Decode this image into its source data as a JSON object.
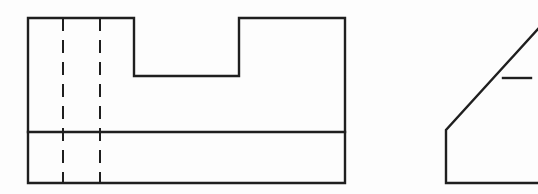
{
  "canvas": {
    "width": 538,
    "height": 194,
    "background_color": "#fdfdfd",
    "line_color": "#1f1f1f",
    "solid_stroke_width": 2.4,
    "hidden_stroke_width": 2.0,
    "hidden_dash_pattern": "13 9"
  },
  "drawing": {
    "type": "orthographic-engineering-drawing",
    "title": "",
    "views": [
      {
        "id": "front-view",
        "name": "Front view with central slot",
        "outline_label": "stepped block outline",
        "outline_points": "28,18 134,18 134,76 239,76 239,18 345,18 345,183 28,183 28,18",
        "features": [
          {
            "id": "horizontal-divider",
            "name": "horizontal divider line",
            "style": "solid",
            "x1": 28,
            "y1": 132,
            "x2": 345,
            "y2": 132
          },
          {
            "id": "hidden-line-left",
            "name": "left hidden edge",
            "style": "hidden",
            "x1": 63,
            "y1": 18,
            "x2": 63,
            "y2": 183
          },
          {
            "id": "hidden-line-right",
            "name": "right hidden edge",
            "style": "hidden",
            "x1": 100,
            "y1": 18,
            "x2": 100,
            "y2": 183
          }
        ]
      },
      {
        "id": "side-view",
        "name": "Side view with chamfer",
        "outline_label": "chamfered block outline",
        "polyline_points": "538,29 446,130 446,183 538,183",
        "features": [
          {
            "id": "chamfer-tick",
            "name": "chamfer reference tick",
            "style": "solid",
            "x1": 503,
            "y1": 78,
            "x2": 531,
            "y2": 78
          }
        ]
      }
    ]
  }
}
